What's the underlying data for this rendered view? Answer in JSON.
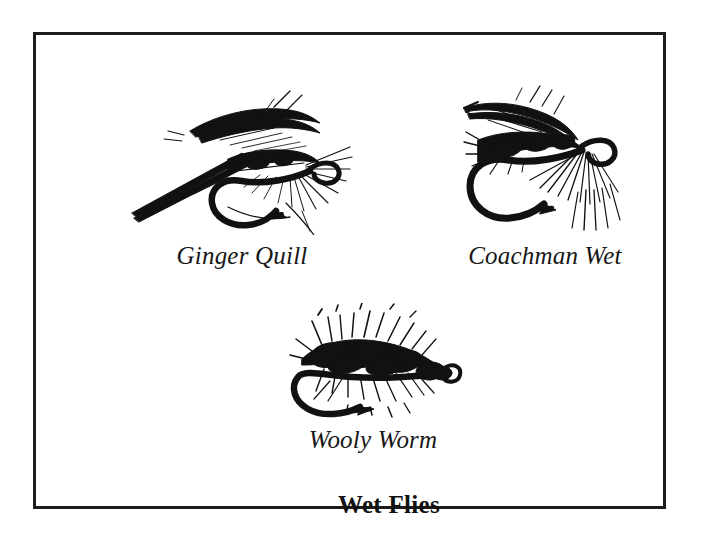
{
  "page": {
    "background_color": "#ffffff",
    "frame_color": "#1c1c1c",
    "ink_color": "#111111"
  },
  "plate": {
    "title": "Wet Flies"
  },
  "figures": [
    {
      "id": "ginger-quill",
      "caption": "Ginger Quill",
      "illustration": "wet-fly-line-drawing"
    },
    {
      "id": "coachman-wet",
      "caption": "Coachman Wet",
      "illustration": "wet-fly-line-drawing"
    },
    {
      "id": "wooly-worm",
      "caption": "Wooly Worm",
      "illustration": "wet-fly-line-drawing"
    }
  ]
}
